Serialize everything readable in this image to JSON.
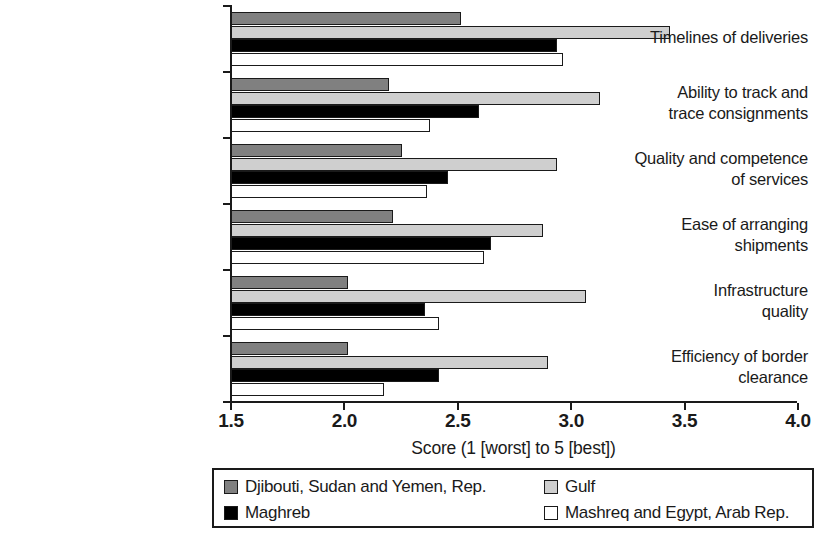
{
  "chart_data": {
    "type": "bar",
    "orientation": "horizontal",
    "title": "",
    "xlabel": "Score (1 [worst] to 5 [best])",
    "ylabel": "",
    "xlim": [
      1.5,
      4.0
    ],
    "xticks": [
      "1.5",
      "2.0",
      "2.5",
      "3.0",
      "3.5",
      "4.0"
    ],
    "xtick_values": [
      1.5,
      2.0,
      2.5,
      3.0,
      3.5,
      4.0
    ],
    "grid": false,
    "legend_position": "bottom",
    "categories": [
      "Timelines of deliveries",
      "Ability to track and trace consignments",
      "Quality and competence of services",
      "Ease of arranging shipments",
      "Infrastructure quality",
      "Efficiency of border clearance"
    ],
    "category_lines": [
      [
        "Timelines of deliveries"
      ],
      [
        "Ability to track and",
        "trace consignments"
      ],
      [
        "Quality and competence",
        "of services"
      ],
      [
        "Ease of arranging",
        "shipments"
      ],
      [
        "Infrastructure",
        "quality"
      ],
      [
        "Efficiency of border",
        "clearance"
      ]
    ],
    "series": [
      {
        "name": "Djibouti, Sudan and Yemen, Rep.",
        "color": "#808080",
        "values": [
          2.52,
          2.2,
          2.26,
          2.22,
          2.02,
          2.02
        ]
      },
      {
        "name": "Gulf",
        "color": "#cfcfcf",
        "values": [
          3.44,
          3.13,
          2.94,
          2.88,
          3.07,
          2.9
        ]
      },
      {
        "name": "Maghreb",
        "color": "#000000",
        "values": [
          2.94,
          2.6,
          2.46,
          2.65,
          2.36,
          2.42
        ]
      },
      {
        "name": "Mashreq and Egypt, Arab Rep.",
        "color": "#ffffff",
        "values": [
          2.97,
          2.38,
          2.37,
          2.62,
          2.42,
          2.18
        ]
      }
    ]
  },
  "legend": {
    "items": [
      {
        "label": "Djibouti, Sudan and Yemen, Rep.",
        "swatch": "s0"
      },
      {
        "label": "Gulf",
        "swatch": "s1"
      },
      {
        "label": "Maghreb",
        "swatch": "s2"
      },
      {
        "label": "Mashreq and Egypt, Arab Rep.",
        "swatch": "s3"
      }
    ]
  }
}
